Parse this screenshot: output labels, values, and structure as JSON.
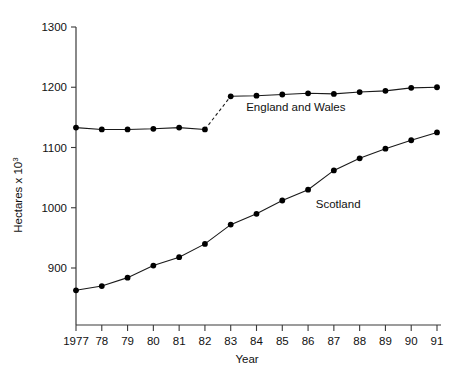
{
  "chart_data": {
    "type": "line",
    "title": "",
    "subtitle": "",
    "xlabel": "Year",
    "ylabel": "Hectares x 10",
    "ylabel_superscript": "3",
    "x": [
      1977,
      1978,
      1979,
      1980,
      1981,
      1982,
      1983,
      1984,
      1985,
      1986,
      1987,
      1988,
      1989,
      1990,
      1991
    ],
    "categories": [
      "1977",
      "78",
      "79",
      "80",
      "81",
      "82",
      "83",
      "84",
      "85",
      "86",
      "87",
      "88",
      "89",
      "90",
      "91"
    ],
    "xlim": [
      1977,
      1991
    ],
    "ylim": [
      860,
      1300
    ],
    "y_ticks": [
      900,
      1000,
      1100,
      1200,
      1300
    ],
    "y_tick_labels": [
      "900",
      "1000",
      "1100",
      "1200",
      "1300"
    ],
    "grid": false,
    "legend": "inline-annotations",
    "series": [
      {
        "name": "England and Wales",
        "label_position": "inline-below-right",
        "marker": "filled-circle",
        "values": [
          1133,
          1130,
          1130,
          1131,
          1133,
          1130,
          1185,
          1186,
          1188,
          1190,
          1189,
          1192,
          1194,
          1199,
          1200
        ],
        "dashed_segment": {
          "from_year": 1982,
          "to_year": 1983
        }
      },
      {
        "name": "Scotland",
        "label_position": "inline-above-right",
        "marker": "filled-circle",
        "values": [
          863,
          870,
          884,
          904,
          918,
          940,
          972,
          990,
          1012,
          1030,
          1062,
          1082,
          1098,
          1112,
          1125
        ],
        "dashed_segment": null
      }
    ],
    "annotations": [
      {
        "text": "England and Wales",
        "x": 1983.6,
        "y": 1160
      },
      {
        "text": "Scotland",
        "x": 1986.3,
        "y": 1000
      }
    ],
    "colors": {
      "line": "#1a1a1a",
      "marker": "#000000",
      "axis": "#3a3a3a",
      "text": "#111111",
      "background": "#ffffff"
    }
  }
}
